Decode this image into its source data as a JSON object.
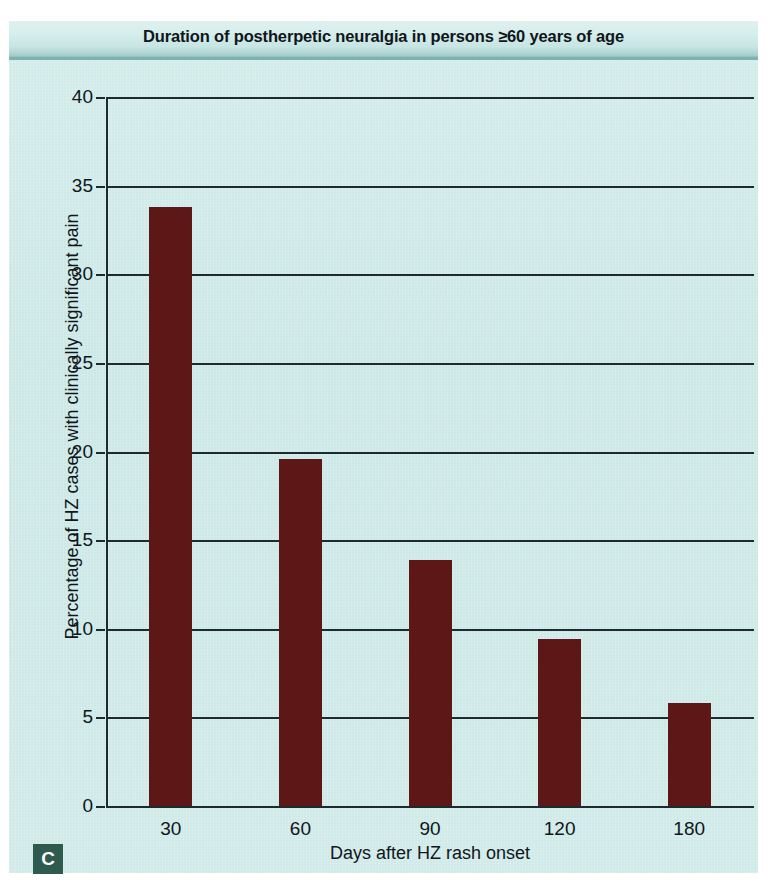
{
  "figure": {
    "title": "Duration of postherpetic neuralgia in persons ≥60 years of age",
    "panel_letter": "C",
    "panel_letter_bg": "#2f5a4e",
    "panel_bg": "#cdeae8",
    "bar_color": "#5e1717",
    "axis_color": "#1d2b31"
  },
  "chart_data": {
    "type": "bar",
    "title": "Duration of postherpetic neuralgia in persons ≥60 years of age",
    "subtitle": "",
    "xlabel": "Days after HZ rash onset",
    "ylabel": "Percentage of HZ cases with clinically significant pain",
    "categories": [
      "30",
      "60",
      "90",
      "120",
      "180"
    ],
    "values": [
      33.8,
      19.6,
      13.9,
      9.4,
      5.8
    ],
    "xlim": [
      0,
      5
    ],
    "ylim": [
      0,
      40
    ],
    "yticks": [
      0,
      5,
      10,
      15,
      20,
      25,
      30,
      35,
      40
    ],
    "ytick_labels": [
      "0",
      "5",
      "10",
      "15",
      "20",
      "25",
      "30",
      "35",
      "40"
    ],
    "xtick_labels": [
      "30",
      "60",
      "90",
      "120",
      "180"
    ],
    "grid": "horizontal",
    "legend": "none",
    "bar_color": "#5e1717"
  }
}
